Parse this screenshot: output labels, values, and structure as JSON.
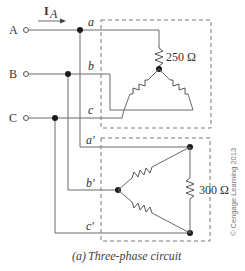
{
  "diagram": {
    "current_label": "I",
    "current_subscript": "A",
    "terminals": [
      {
        "label": "A",
        "node": "a"
      },
      {
        "label": "B",
        "node": "b"
      },
      {
        "label": "C",
        "node": "c"
      }
    ],
    "load1": {
      "nodes": [
        "a",
        "b",
        "c"
      ],
      "type": "Y",
      "resistance_label": "250 Ω"
    },
    "load2": {
      "nodes": [
        "a′",
        "b′",
        "c′"
      ],
      "type": "Δ",
      "resistance_label": "300 Ω"
    },
    "caption_prefix": "(a)",
    "caption": "Three-phase circuit",
    "copyright": "© Cengage Learning 2013",
    "colors": {
      "wire": "#6a6a6a",
      "dot": "#1a1a1a",
      "dash": "#7a7a7a"
    }
  }
}
